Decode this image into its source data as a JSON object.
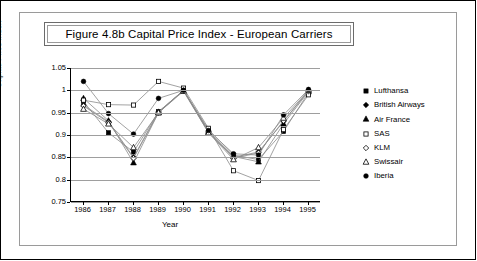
{
  "figure": {
    "title": "Figure 4.8b  Capital Price Index - European Carriers"
  },
  "chart_data": {
    "type": "line",
    "title": "Figure 4.8b  Capital Price Index - European Carriers",
    "xlabel": "Year",
    "ylabel": "Capital Price Index",
    "categories": [
      "1986",
      "1987",
      "1988",
      "1989",
      "1990",
      "1991",
      "1992",
      "1993",
      "1994",
      "1995"
    ],
    "x": [
      1986,
      1987,
      1988,
      1989,
      1990,
      1991,
      1992,
      1993,
      1994,
      1995
    ],
    "ylim": [
      0.75,
      1.05
    ],
    "yticks": [
      "0.75",
      "0.8",
      "0.85",
      "0.9",
      "0.95",
      "1",
      "1.05"
    ],
    "ytick_values": [
      0.75,
      0.8,
      0.85,
      0.9,
      0.95,
      1.0,
      1.05
    ],
    "grid": true,
    "legend_position": "right",
    "series": [
      {
        "name": "Lufthansa",
        "marker": "filled-square",
        "values": [
          0.975,
          0.905,
          0.862,
          0.952,
          1.0,
          0.912,
          0.855,
          0.845,
          0.908,
          0.995
        ]
      },
      {
        "name": "British Airways",
        "marker": "filled-diamond",
        "values": [
          0.967,
          0.93,
          0.85,
          0.952,
          1.0,
          0.905,
          0.85,
          0.862,
          0.93,
          1.0
        ]
      },
      {
        "name": "Air France",
        "marker": "filled-triangle",
        "values": [
          0.982,
          0.932,
          0.838,
          0.95,
          1.0,
          0.907,
          0.852,
          0.84,
          0.925,
          0.997
        ]
      },
      {
        "name": "SAS",
        "marker": "open-square",
        "values": [
          0.978,
          0.968,
          0.967,
          1.02,
          1.005,
          0.915,
          0.82,
          0.798,
          0.912,
          0.99
        ]
      },
      {
        "name": "KLM",
        "marker": "open-diamond",
        "values": [
          0.965,
          0.928,
          0.848,
          0.95,
          1.0,
          0.908,
          0.848,
          0.86,
          0.932,
          0.998
        ]
      },
      {
        "name": "Swissair",
        "marker": "open-triangle",
        "values": [
          0.958,
          0.925,
          0.872,
          0.95,
          0.998,
          0.905,
          0.845,
          0.872,
          0.938,
          1.0
        ]
      },
      {
        "name": "Iberia",
        "marker": "filled-circle",
        "values": [
          1.02,
          0.948,
          0.902,
          0.982,
          1.0,
          0.91,
          0.858,
          0.855,
          0.945,
          1.002
        ]
      }
    ]
  },
  "legend": {
    "items": [
      {
        "label": "Lufthansa"
      },
      {
        "label": "British Airways"
      },
      {
        "label": "Air France"
      },
      {
        "label": "SAS"
      },
      {
        "label": "KLM"
      },
      {
        "label": "Swissair"
      },
      {
        "label": "Iberia"
      }
    ]
  },
  "colors": {
    "line": "#8a8a8a",
    "marker": "#000000",
    "grid": "#9e9e9e",
    "axis": "#000000",
    "background": "#ffffff",
    "frame": "#9a9a9a"
  }
}
